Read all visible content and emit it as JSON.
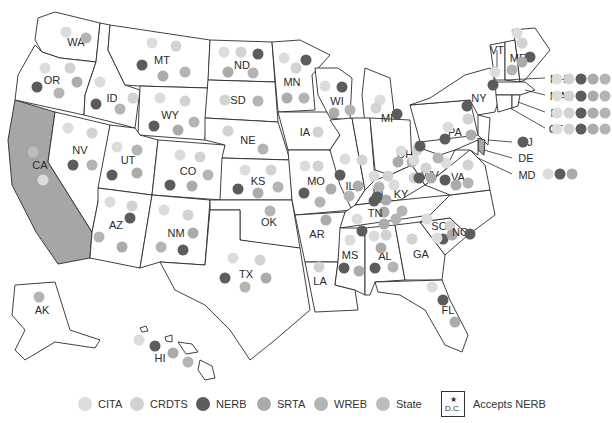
{
  "legend": {
    "items": [
      {
        "key": "CITA",
        "label": "CITA",
        "color": "#dcdcdc"
      },
      {
        "key": "CRDTS",
        "label": "CRDTS",
        "color": "#d2d2d2"
      },
      {
        "key": "NERB",
        "label": "NERB",
        "color": "#5c5c5c"
      },
      {
        "key": "SRTA",
        "label": "SRTA",
        "color": "#ababab"
      },
      {
        "key": "WREB",
        "label": "WREB",
        "color": "#b4b4b4"
      },
      {
        "key": "State",
        "label": "State",
        "color": "#bdbdbd"
      }
    ],
    "dc_star": "★",
    "dc_label": "D.C.",
    "dc_text": "Accepts NERB"
  },
  "highlight_color": "#a6a6a6",
  "states": {
    "WA": {
      "label": "WA",
      "boards": [
        "CITA",
        "WREB"
      ]
    },
    "OR": {
      "label": "OR",
      "boards": [
        "CITA",
        "CRDTS",
        "NERB",
        "SRTA",
        "WREB"
      ]
    },
    "CA": {
      "label": "CA",
      "boards": [
        "State",
        "CITA"
      ],
      "highlighted": true
    },
    "NV": {
      "label": "NV",
      "boards": [
        "CITA",
        "CRDTS",
        "NERB",
        "WREB"
      ]
    },
    "ID": {
      "label": "ID",
      "boards": [
        "CITA",
        "NERB",
        "CRDTS",
        "WREB"
      ]
    },
    "MT": {
      "label": "MT",
      "boards": [
        "CITA",
        "CRDTS",
        "NERB",
        "SRTA",
        "WREB"
      ]
    },
    "WY": {
      "label": "WY",
      "boards": [
        "CITA",
        "CRDTS",
        "NERB",
        "SRTA",
        "WREB"
      ]
    },
    "UT": {
      "label": "UT",
      "boards": [
        "CITA",
        "WREB",
        "NERB",
        "SRTA"
      ]
    },
    "CO": {
      "label": "CO",
      "boards": [
        "CITA",
        "CRDTS",
        "NERB",
        "SRTA",
        "WREB"
      ]
    },
    "AZ": {
      "label": "AZ",
      "boards": [
        "CITA",
        "CRDTS",
        "WREB",
        "NERB",
        "SRTA"
      ]
    },
    "NM": {
      "label": "NM",
      "boards": [
        "CITA",
        "CRDTS",
        "WREB",
        "NERB",
        "SRTA"
      ]
    },
    "ND": {
      "label": "ND",
      "boards": [
        "CITA",
        "CRDTS",
        "NERB",
        "SRTA",
        "WREB"
      ]
    },
    "SD": {
      "label": "SD",
      "boards": [
        "CRDTS",
        "WREB"
      ]
    },
    "NE": {
      "label": "NE",
      "boards": [
        "CRDTS",
        "WREB"
      ]
    },
    "KS": {
      "label": "KS",
      "boards": [
        "CITA",
        "CRDTS",
        "NERB",
        "SRTA",
        "WREB"
      ]
    },
    "OK": {
      "label": "OK",
      "boards": [
        "WREB"
      ]
    },
    "TX": {
      "label": "TX",
      "boards": [
        "CITA",
        "CRDTS",
        "NERB",
        "SRTA",
        "WREB"
      ]
    },
    "MN": {
      "label": "MN",
      "boards": [
        "CITA",
        "NERB",
        "CRDTS",
        "SRTA",
        "WREB"
      ]
    },
    "IA": {
      "label": "IA",
      "boards": [
        "CRDTS"
      ]
    },
    "MO": {
      "label": "MO",
      "boards": [
        "CITA",
        "CRDTS",
        "NERB",
        "SRTA",
        "WREB"
      ]
    },
    "AR": {
      "label": "AR",
      "boards": [
        "SRTA"
      ]
    },
    "LA": {
      "label": "LA",
      "boards": [
        "CRDTS"
      ]
    },
    "WI": {
      "label": "WI",
      "boards": [
        "CITA",
        "NERB",
        "SRTA",
        "WREB"
      ]
    },
    "IL": {
      "label": "IL",
      "boards": [
        "CITA",
        "CRDTS",
        "NERB",
        "SRTA",
        "WREB"
      ]
    },
    "MI": {
      "label": "MI",
      "boards": [
        "CITA",
        "CRDTS",
        "NERB"
      ]
    },
    "IN": {
      "label": "IN",
      "boards": [
        "CITA",
        "CRDTS",
        "NERB",
        "SRTA",
        "WREB"
      ]
    },
    "OH": {
      "label": "OH",
      "boards": [
        "CITA",
        "CRDTS",
        "NERB",
        "SRTA",
        "WREB"
      ]
    },
    "KY": {
      "label": "KY",
      "boards": [
        "CITA",
        "CRDTS",
        "NERB",
        "SRTA",
        "WREB"
      ]
    },
    "TN": {
      "label": "TN",
      "boards": [
        "CITA",
        "NERB",
        "SRTA",
        "WREB"
      ]
    },
    "MS": {
      "label": "MS",
      "boards": [
        "CITA",
        "NERB",
        "SRTA"
      ]
    },
    "AL": {
      "label": "AL",
      "boards": [
        "CITA",
        "CRDTS",
        "SRTA",
        "NERB",
        "WREB"
      ]
    },
    "GA": {
      "label": "GA",
      "boards": [
        "CRDTS"
      ]
    },
    "FL": {
      "label": "FL",
      "boards": [
        "CITA",
        "NERB",
        "SRTA"
      ]
    },
    "SC": {
      "label": "SC",
      "boards": [
        "CITA",
        "CRDTS",
        "NERB",
        "SRTA"
      ]
    },
    "NC": {
      "label": "NC",
      "boards": [
        "CITA",
        "NERB"
      ]
    },
    "VA": {
      "label": "VA",
      "boards": [
        "CITA",
        "CRDTS",
        "NERB",
        "SRTA",
        "WREB"
      ]
    },
    "WV": {
      "label": "WV",
      "boards": [
        "CITA",
        "CRDTS",
        "NERB",
        "SRTA",
        "WREB"
      ]
    },
    "PA": {
      "label": "PA",
      "boards": [
        "CITA",
        "CRDTS",
        "NERB",
        "SRTA"
      ]
    },
    "NY": {
      "label": "NY",
      "boards": [
        "NERB"
      ]
    },
    "VT": {
      "label": "VT",
      "boards": [
        "CITA",
        "NERB"
      ]
    },
    "ME": {
      "label": "ME",
      "boards": [
        "CITA",
        "CRDTS",
        "NERB",
        "SRTA",
        "WREB"
      ]
    },
    "NH": {
      "label": "NH",
      "boards": [
        "CITA",
        "CRDTS",
        "NERB",
        "SRTA",
        "WREB"
      ]
    },
    "MA": {
      "label": "MA",
      "boards": [
        "CITA",
        "CRDTS",
        "NERB",
        "SRTA",
        "WREB"
      ]
    },
    "RI": {
      "label": "RI",
      "boards": [
        "CITA",
        "CRDTS",
        "NERB",
        "SRTA",
        "WREB"
      ]
    },
    "CT": {
      "label": "CT",
      "boards": [
        "CITA",
        "CRDTS",
        "NERB",
        "SRTA",
        "WREB"
      ]
    },
    "NJ": {
      "label": "NJ",
      "boards": [
        "NERB"
      ]
    },
    "DE": {
      "label": "DE",
      "boards": []
    },
    "MD": {
      "label": "MD",
      "boards": [
        "CITA",
        "NERB",
        "SRTA"
      ]
    },
    "AK": {
      "label": "AK",
      "boards": [
        "WREB"
      ]
    },
    "HI": {
      "label": "HI",
      "boards": [
        "CITA",
        "NERB",
        "SRTA",
        "WREB"
      ]
    }
  }
}
